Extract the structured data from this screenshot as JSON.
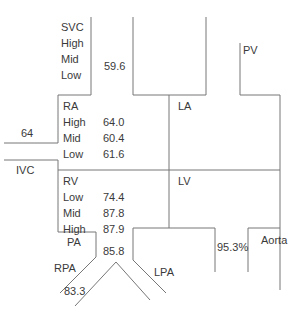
{
  "diagram": {
    "type": "cardiac oxygen saturation diagram",
    "line_color": "#777777",
    "text_color": "#3a3a3a",
    "svc": {
      "label": "SVC",
      "rows": [
        "High",
        "Mid",
        "Low"
      ],
      "value": "59.6"
    },
    "pv": {
      "label": "PV"
    },
    "ra": {
      "label": "RA",
      "rows": [
        {
          "level": "High",
          "value": "64.0"
        },
        {
          "level": "Mid",
          "value": "60.4"
        },
        {
          "level": "Low",
          "value": "61.6"
        }
      ]
    },
    "ra_side_value": "64",
    "la": {
      "label": "LA"
    },
    "ivc": {
      "label": "IVC"
    },
    "rv": {
      "label": "RV",
      "rows": [
        {
          "level": "Low",
          "value": "74.4"
        },
        {
          "level": "Mid",
          "value": "87.8"
        },
        {
          "level": "High",
          "value": "87.9"
        }
      ]
    },
    "lv": {
      "label": "LV"
    },
    "pa": {
      "label": "PA",
      "value": "85.8"
    },
    "rpa": {
      "label": "RPA",
      "value": "83.3"
    },
    "lpa": {
      "label": "LPA"
    },
    "aorta": {
      "label": "Aorta",
      "value": "95.3%"
    }
  }
}
